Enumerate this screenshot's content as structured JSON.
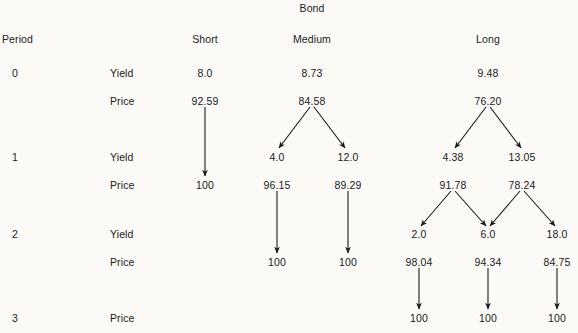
{
  "figure": {
    "title": "Bond",
    "period_header": "Period",
    "column_headers": [
      {
        "label": "Short",
        "x": 205
      },
      {
        "label": "Medium",
        "x": 312
      },
      {
        "label": "Long",
        "x": 488
      }
    ],
    "periods": [
      {
        "label": "0",
        "x": 12,
        "y": 73
      },
      {
        "label": "1",
        "x": 12,
        "y": 157
      },
      {
        "label": "2",
        "x": 12,
        "y": 234
      },
      {
        "label": "3",
        "x": 12,
        "y": 318
      }
    ],
    "row_labels": [
      {
        "label": "Yield",
        "x": 110,
        "y": 73
      },
      {
        "label": "Price",
        "x": 110,
        "y": 101
      },
      {
        "label": "Yield",
        "x": 110,
        "y": 157
      },
      {
        "label": "Price",
        "x": 110,
        "y": 185
      },
      {
        "label": "Yield",
        "x": 110,
        "y": 234
      },
      {
        "label": "Price",
        "x": 110,
        "y": 262
      },
      {
        "label": "Price",
        "x": 110,
        "y": 318
      }
    ],
    "values": [
      {
        "text": "8.0",
        "x": 205,
        "y": 73,
        "kind": "yield",
        "bond": "Short",
        "period": 0
      },
      {
        "text": "92.59",
        "x": 205,
        "y": 101,
        "kind": "price",
        "bond": "Short",
        "period": 0
      },
      {
        "text": "100",
        "x": 205,
        "y": 185,
        "kind": "price",
        "bond": "Short",
        "period": 1
      },
      {
        "text": "8.73",
        "x": 312,
        "y": 73,
        "kind": "yield",
        "bond": "Medium",
        "period": 0
      },
      {
        "text": "84.58",
        "x": 312,
        "y": 101,
        "kind": "price",
        "bond": "Medium",
        "period": 0
      },
      {
        "text": "4.0",
        "x": 277,
        "y": 157,
        "kind": "yield",
        "bond": "Medium",
        "period": 1
      },
      {
        "text": "12.0",
        "x": 348,
        "y": 157,
        "kind": "yield",
        "bond": "Medium",
        "period": 1
      },
      {
        "text": "96.15",
        "x": 277,
        "y": 185,
        "kind": "price",
        "bond": "Medium",
        "period": 1
      },
      {
        "text": "89.29",
        "x": 348,
        "y": 185,
        "kind": "price",
        "bond": "Medium",
        "period": 1
      },
      {
        "text": "100",
        "x": 277,
        "y": 262,
        "kind": "price",
        "bond": "Medium",
        "period": 2
      },
      {
        "text": "100",
        "x": 348,
        "y": 262,
        "kind": "price",
        "bond": "Medium",
        "period": 2
      },
      {
        "text": "9.48",
        "x": 488,
        "y": 73,
        "kind": "yield",
        "bond": "Long",
        "period": 0
      },
      {
        "text": "76.20",
        "x": 488,
        "y": 101,
        "kind": "price",
        "bond": "Long",
        "period": 0
      },
      {
        "text": "4.38",
        "x": 453,
        "y": 157,
        "kind": "yield",
        "bond": "Long",
        "period": 1
      },
      {
        "text": "13.05",
        "x": 522,
        "y": 157,
        "kind": "yield",
        "bond": "Long",
        "period": 1
      },
      {
        "text": "91.78",
        "x": 453,
        "y": 185,
        "kind": "price",
        "bond": "Long",
        "period": 1
      },
      {
        "text": "78.24",
        "x": 522,
        "y": 185,
        "kind": "price",
        "bond": "Long",
        "period": 1
      },
      {
        "text": "2.0",
        "x": 419,
        "y": 234,
        "kind": "yield",
        "bond": "Long",
        "period": 2
      },
      {
        "text": "6.0",
        "x": 488,
        "y": 234,
        "kind": "yield",
        "bond": "Long",
        "period": 2
      },
      {
        "text": "18.0",
        "x": 557,
        "y": 234,
        "kind": "yield",
        "bond": "Long",
        "period": 2
      },
      {
        "text": "98.04",
        "x": 419,
        "y": 262,
        "kind": "price",
        "bond": "Long",
        "period": 2
      },
      {
        "text": "94.34",
        "x": 488,
        "y": 262,
        "kind": "price",
        "bond": "Long",
        "period": 2
      },
      {
        "text": "84.75",
        "x": 557,
        "y": 262,
        "kind": "price",
        "bond": "Long",
        "period": 2
      },
      {
        "text": "100",
        "x": 419,
        "y": 318,
        "kind": "price",
        "bond": "Long",
        "period": 3
      },
      {
        "text": "100",
        "x": 488,
        "y": 318,
        "kind": "price",
        "bond": "Long",
        "period": 3
      },
      {
        "text": "100",
        "x": 557,
        "y": 318,
        "kind": "price",
        "bond": "Long",
        "period": 3
      }
    ],
    "arrows": [
      {
        "x1": 205,
        "y1": 107,
        "x2": 205,
        "y2": 176,
        "name": "arrow-short-p0-to-p1"
      },
      {
        "x1": 310,
        "y1": 107,
        "x2": 279,
        "y2": 148,
        "name": "arrow-medium-p0-to-down"
      },
      {
        "x1": 314,
        "y1": 107,
        "x2": 345,
        "y2": 148,
        "name": "arrow-medium-p0-to-up"
      },
      {
        "x1": 277,
        "y1": 191,
        "x2": 277,
        "y2": 253,
        "name": "arrow-medium-p1-low-to-p2"
      },
      {
        "x1": 348,
        "y1": 191,
        "x2": 348,
        "y2": 253,
        "name": "arrow-medium-p1-high-to-p2"
      },
      {
        "x1": 486,
        "y1": 107,
        "x2": 455,
        "y2": 148,
        "name": "arrow-long-p0-to-down"
      },
      {
        "x1": 490,
        "y1": 107,
        "x2": 521,
        "y2": 148,
        "name": "arrow-long-p0-to-up"
      },
      {
        "x1": 451,
        "y1": 191,
        "x2": 421,
        "y2": 226,
        "name": "arrow-long-p1-low-to-down"
      },
      {
        "x1": 455,
        "y1": 191,
        "x2": 486,
        "y2": 226,
        "name": "arrow-long-p1-low-to-up"
      },
      {
        "x1": 520,
        "y1": 191,
        "x2": 490,
        "y2": 226,
        "name": "arrow-long-p1-high-to-down"
      },
      {
        "x1": 524,
        "y1": 191,
        "x2": 555,
        "y2": 226,
        "name": "arrow-long-p1-high-to-up"
      },
      {
        "x1": 419,
        "y1": 268,
        "x2": 419,
        "y2": 309,
        "name": "arrow-long-p2-to-p3-a"
      },
      {
        "x1": 488,
        "y1": 268,
        "x2": 488,
        "y2": 309,
        "name": "arrow-long-p2-to-p3-b"
      },
      {
        "x1": 557,
        "y1": 268,
        "x2": 557,
        "y2": 309,
        "name": "arrow-long-p2-to-p3-c"
      }
    ],
    "colors": {
      "background": "#fbfaf7",
      "text": "#1a1a1a",
      "arrow": "#1a1a1a"
    }
  },
  "chart_data": {
    "type": "diagram",
    "title": "Bond",
    "xlabel": "Bond",
    "ylabel": "Period",
    "categories": [
      "Short",
      "Medium",
      "Long"
    ],
    "periods": [
      0,
      1,
      2,
      3
    ],
    "series": [
      {
        "name": "Short",
        "nodes": [
          {
            "period": 0,
            "yield": 8.0,
            "price": 92.59
          },
          {
            "period": 1,
            "yield": null,
            "price": 100
          }
        ]
      },
      {
        "name": "Medium",
        "nodes": [
          {
            "period": 0,
            "yield": 8.73,
            "price": 84.58
          },
          {
            "period": 1,
            "yield": 4.0,
            "price": 96.15
          },
          {
            "period": 1,
            "yield": 12.0,
            "price": 89.29
          },
          {
            "period": 2,
            "yield": null,
            "price": 100
          },
          {
            "period": 2,
            "yield": null,
            "price": 100
          }
        ]
      },
      {
        "name": "Long",
        "nodes": [
          {
            "period": 0,
            "yield": 9.48,
            "price": 76.2
          },
          {
            "period": 1,
            "yield": 4.38,
            "price": 91.78
          },
          {
            "period": 1,
            "yield": 13.05,
            "price": 78.24
          },
          {
            "period": 2,
            "yield": 2.0,
            "price": 98.04
          },
          {
            "period": 2,
            "yield": 6.0,
            "price": 94.34
          },
          {
            "period": 2,
            "yield": 18.0,
            "price": 84.75
          },
          {
            "period": 3,
            "yield": null,
            "price": 100
          },
          {
            "period": 3,
            "yield": null,
            "price": 100
          },
          {
            "period": 3,
            "yield": null,
            "price": 100
          }
        ]
      }
    ]
  }
}
